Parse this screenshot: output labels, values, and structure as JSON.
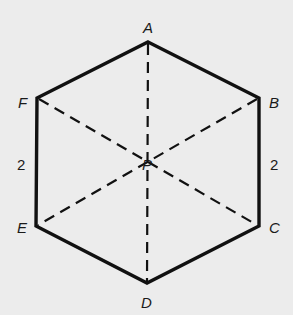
{
  "diagram": {
    "title": "",
    "shape": "hexagon",
    "center_label": "P",
    "vertices": [
      {
        "id": "A",
        "label": "A",
        "x": 148,
        "y": 42
      },
      {
        "id": "B",
        "label": "B",
        "x": 259,
        "y": 98
      },
      {
        "id": "C",
        "label": "C",
        "x": 259,
        "y": 226
      },
      {
        "id": "D",
        "label": "D",
        "x": 147,
        "y": 283
      },
      {
        "id": "E",
        "label": "E",
        "x": 36,
        "y": 226
      },
      {
        "id": "F",
        "label": "F",
        "x": 37,
        "y": 98
      }
    ],
    "center": {
      "label": "P",
      "x": 148,
      "y": 163
    },
    "side_labels": [
      {
        "side": "FE",
        "text": "2"
      },
      {
        "side": "BC",
        "text": "2"
      }
    ],
    "dashed_segments": [
      "AD",
      "FC",
      "BE"
    ],
    "colors": {
      "stroke": "#111111",
      "background": "#ececec"
    }
  }
}
